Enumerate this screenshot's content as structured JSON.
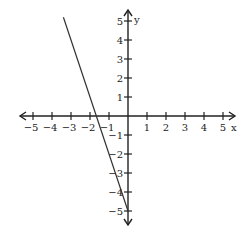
{
  "chart_data": {
    "type": "line",
    "title": "",
    "xlabel": "x",
    "ylabel": "y",
    "xlim": [
      -5,
      5
    ],
    "ylim": [
      -5,
      5
    ],
    "x_ticks": [
      -5,
      -4,
      -3,
      -2,
      -1,
      1,
      2,
      3,
      4,
      5
    ],
    "y_ticks": [
      -5,
      -4,
      -3,
      -2,
      -1,
      1,
      2,
      3,
      4,
      5
    ],
    "x_tick_labels": [
      "-5",
      "-4",
      "-3",
      "-2",
      "-1",
      "1",
      "2",
      "3",
      "4",
      "5"
    ],
    "y_tick_labels": [
      "-5",
      "-4",
      "-3",
      "-2",
      "-1",
      "1",
      "2",
      "3",
      "4",
      "5"
    ],
    "grid": false,
    "series": [
      {
        "name": "line",
        "equation": "y = -3x - 5",
        "x": [
          -3.4,
          0
        ],
        "y": [
          5.2,
          -5
        ]
      }
    ],
    "colors": {
      "axis": "#222222",
      "line": "#333333"
    }
  }
}
